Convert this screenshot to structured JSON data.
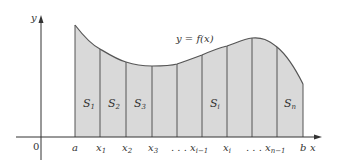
{
  "diagram": {
    "curve_label": "y = f(x)",
    "axis_labels": {
      "y": "y",
      "x": "x",
      "origin": "0"
    },
    "colors": {
      "fill": "#d9d9d9",
      "stroke": "#555555",
      "axis": "#333333",
      "text": "#333333"
    },
    "tick_labels": [
      {
        "main": "a",
        "sub": ""
      },
      {
        "main": "x",
        "sub": "1"
      },
      {
        "main": "x",
        "sub": "2"
      },
      {
        "main": "x",
        "sub": "3"
      },
      {
        "main": ". . . x",
        "sub": "i−1"
      },
      {
        "main": "x",
        "sub": "i"
      },
      {
        "main": ". . . x",
        "sub": "n−1"
      },
      {
        "main": "b",
        "sub": ""
      }
    ],
    "strip_labels": [
      {
        "main": "S",
        "sub": "1"
      },
      {
        "main": "S",
        "sub": "2"
      },
      {
        "main": "S",
        "sub": "3"
      },
      {
        "main": "S",
        "sub": "i"
      },
      {
        "main": "S",
        "sub": "n"
      }
    ]
  }
}
